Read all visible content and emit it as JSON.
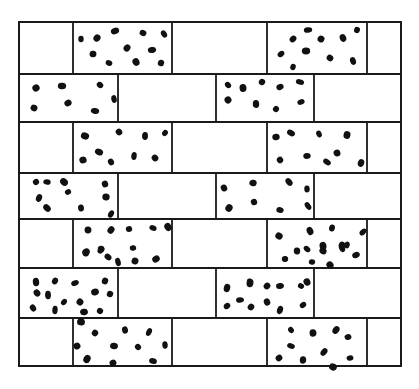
{
  "diagram": {
    "type": "brick-wall-pattern",
    "colors": {
      "line": "#1a1a1a",
      "dot": "#111111",
      "background": "#ffffff"
    },
    "frame": {
      "x1": 19,
      "y1": 22,
      "x2": 401,
      "y2": 366
    },
    "row_boundaries": [
      22,
      74,
      122,
      173,
      219,
      268,
      318,
      366
    ],
    "rows": [
      {
        "index": 1,
        "dividers": [
          73,
          172,
          267,
          367
        ],
        "dotted_bricks": [
          [
            73,
            172
          ],
          [
            267,
            367
          ]
        ]
      },
      {
        "index": 2,
        "dividers": [
          118,
          216,
          314
        ],
        "dotted_bricks": [
          [
            19,
            118
          ],
          [
            216,
            314
          ]
        ]
      },
      {
        "index": 3,
        "dividers": [
          73,
          172,
          267,
          367
        ],
        "dotted_bricks": [
          [
            73,
            172
          ],
          [
            267,
            367
          ]
        ]
      },
      {
        "index": 4,
        "dividers": [
          118,
          216,
          314
        ],
        "dotted_bricks": [
          [
            19,
            118
          ],
          [
            216,
            314
          ]
        ]
      },
      {
        "index": 5,
        "dividers": [
          73,
          172,
          267,
          367
        ],
        "dotted_bricks": [
          [
            73,
            172
          ],
          [
            267,
            367
          ]
        ]
      },
      {
        "index": 6,
        "dividers": [
          118,
          216,
          314
        ],
        "dotted_bricks": [
          [
            19,
            118
          ],
          [
            216,
            314
          ]
        ]
      },
      {
        "index": 7,
        "dividers": [
          73,
          172,
          267,
          367
        ],
        "dotted_bricks": [
          [
            73,
            172
          ],
          [
            267,
            367
          ]
        ]
      }
    ],
    "dots": [
      [
        81,
        39
      ],
      [
        97,
        38
      ],
      [
        115,
        31
      ],
      [
        143,
        33
      ],
      [
        164,
        34
      ],
      [
        93,
        54
      ],
      [
        127,
        48
      ],
      [
        152,
        50
      ],
      [
        109,
        63
      ],
      [
        136,
        62
      ],
      [
        161,
        63
      ],
      [
        293,
        39
      ],
      [
        308,
        30
      ],
      [
        321,
        39
      ],
      [
        343,
        38
      ],
      [
        357,
        30
      ],
      [
        281,
        54
      ],
      [
        306,
        51
      ],
      [
        330,
        58
      ],
      [
        353,
        61
      ],
      [
        293,
        67
      ],
      [
        36,
        88
      ],
      [
        62,
        86
      ],
      [
        100,
        85
      ],
      [
        114,
        99
      ],
      [
        34,
        108
      ],
      [
        68,
        103
      ],
      [
        95,
        111
      ],
      [
        228,
        85
      ],
      [
        243,
        88
      ],
      [
        262,
        82
      ],
      [
        280,
        87
      ],
      [
        300,
        82
      ],
      [
        228,
        100
      ],
      [
        256,
        104
      ],
      [
        276,
        109
      ],
      [
        301,
        102
      ],
      [
        85,
        136
      ],
      [
        119,
        132
      ],
      [
        145,
        136
      ],
      [
        165,
        133
      ],
      [
        83,
        160
      ],
      [
        99,
        152
      ],
      [
        111,
        162
      ],
      [
        134,
        156
      ],
      [
        155,
        158
      ],
      [
        276,
        137
      ],
      [
        291,
        133
      ],
      [
        319,
        134
      ],
      [
        347,
        135
      ],
      [
        280,
        160
      ],
      [
        307,
        156
      ],
      [
        327,
        162
      ],
      [
        337,
        153
      ],
      [
        361,
        163
      ],
      [
        36,
        182
      ],
      [
        47,
        182
      ],
      [
        64,
        182
      ],
      [
        105,
        184
      ],
      [
        39,
        198
      ],
      [
        68,
        192
      ],
      [
        106,
        197
      ],
      [
        47,
        208
      ],
      [
        81,
        208
      ],
      [
        111,
        214
      ],
      [
        224,
        188
      ],
      [
        253,
        183
      ],
      [
        289,
        182
      ],
      [
        307,
        189
      ],
      [
        229,
        208
      ],
      [
        254,
        202
      ],
      [
        280,
        210
      ],
      [
        308,
        206
      ],
      [
        88,
        230
      ],
      [
        111,
        230
      ],
      [
        129,
        229
      ],
      [
        153,
        228
      ],
      [
        168,
        227
      ],
      [
        86,
        253
      ],
      [
        101,
        250
      ],
      [
        133,
        248
      ],
      [
        279,
        236
      ],
      [
        310,
        231
      ],
      [
        332,
        228
      ],
      [
        363,
        232
      ],
      [
        297,
        251
      ],
      [
        323,
        251
      ],
      [
        342,
        248
      ],
      [
        347,
        245
      ],
      [
        86,
        252
      ],
      [
        101,
        249
      ],
      [
        108,
        257
      ],
      [
        118,
        262
      ],
      [
        135,
        261
      ],
      [
        156,
        259
      ],
      [
        285,
        259
      ],
      [
        307,
        249
      ],
      [
        323,
        246
      ],
      [
        342,
        245
      ],
      [
        356,
        255
      ],
      [
        312,
        262
      ],
      [
        330,
        265
      ],
      [
        36,
        282
      ],
      [
        55,
        281
      ],
      [
        75,
        283
      ],
      [
        105,
        281
      ],
      [
        37,
        293
      ],
      [
        48,
        295
      ],
      [
        64,
        302
      ],
      [
        95,
        292
      ],
      [
        110,
        294
      ],
      [
        33,
        308
      ],
      [
        55,
        310
      ],
      [
        80,
        302
      ],
      [
        84,
        312
      ],
      [
        100,
        311
      ],
      [
        250,
        282
      ],
      [
        250,
        283
      ],
      [
        267,
        286
      ],
      [
        280,
        286
      ],
      [
        301,
        286
      ],
      [
        307,
        282
      ],
      [
        227,
        288
      ],
      [
        227,
        306
      ],
      [
        240,
        300
      ],
      [
        251,
        307
      ],
      [
        267,
        302
      ],
      [
        280,
        310
      ],
      [
        303,
        305
      ],
      [
        81,
        322
      ],
      [
        95,
        333
      ],
      [
        125,
        330
      ],
      [
        149,
        332
      ],
      [
        77,
        346
      ],
      [
        114,
        346
      ],
      [
        138,
        347
      ],
      [
        165,
        345
      ],
      [
        87,
        359
      ],
      [
        113,
        363
      ],
      [
        153,
        361
      ],
      [
        291,
        330
      ],
      [
        313,
        333
      ],
      [
        336,
        330
      ],
      [
        348,
        337
      ],
      [
        291,
        346
      ],
      [
        279,
        358
      ],
      [
        303,
        360
      ],
      [
        324,
        352
      ],
      [
        350,
        358
      ],
      [
        333,
        367
      ]
    ]
  }
}
